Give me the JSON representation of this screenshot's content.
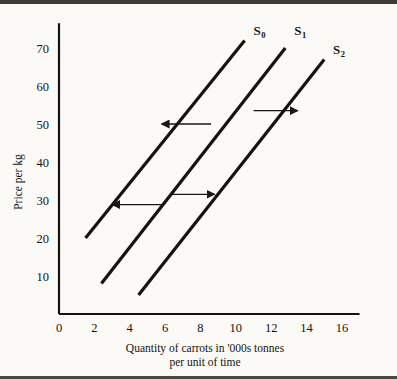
{
  "figure": {
    "background_color": "#fbfaf7",
    "ink_color": "#151310",
    "border_color": "#3d3a33"
  },
  "chart_data": {
    "type": "line",
    "title": "",
    "xlabel_line1": "Quantity of carrots in '000s tonnes",
    "xlabel_line2": "per unit of time",
    "ylabel": "Price per kg",
    "xlim": [
      0,
      17
    ],
    "ylim": [
      0,
      76
    ],
    "grid": false,
    "legend_position": "inline-at-curve-end",
    "xticks": [
      0,
      2,
      4,
      6,
      8,
      10,
      12,
      14,
      16
    ],
    "xticklabels": [
      "0",
      "2",
      "4",
      "6",
      "8",
      "10",
      "12",
      "14",
      "16"
    ],
    "yticks": [
      10,
      20,
      30,
      40,
      50,
      60,
      70
    ],
    "yticklabels": [
      "10",
      "20",
      "30",
      "40",
      "50",
      "60",
      "70"
    ],
    "series": [
      {
        "name": "S0",
        "label_base": "S",
        "label_sub": "0",
        "x": [
          1.5,
          10.5
        ],
        "y": [
          20,
          72
        ],
        "label_x": 11.0,
        "label_y": 73.5
      },
      {
        "name": "S1",
        "label_base": "S",
        "label_sub": "1",
        "x": [
          2.4,
          12.8
        ],
        "y": [
          8,
          70
        ],
        "label_x": 13.3,
        "label_y": 73.5
      },
      {
        "name": "S2",
        "label_base": "S",
        "label_sub": "2",
        "x": [
          4.5,
          15.0
        ],
        "y": [
          5,
          67
        ],
        "label_x": 15.5,
        "label_y": 68.5
      }
    ],
    "annotations": [
      {
        "name": "shift-arrow-upper-left",
        "direction": "left",
        "x_from": 8.6,
        "x_to": 5.8,
        "y": 50.0,
        "meaning": "decrease in supply: S1 shifts left to S0"
      },
      {
        "name": "shift-arrow-upper-right",
        "direction": "right",
        "x_from": 11.0,
        "x_to": 13.5,
        "y": 53.5,
        "meaning": "increase in supply: S1 shifts right to S2"
      },
      {
        "name": "shift-arrow-lower-left",
        "direction": "left",
        "x_from": 5.9,
        "x_to": 3.0,
        "y": 28.8,
        "meaning": "decrease in supply: S1 shifts left to S0"
      },
      {
        "name": "shift-arrow-lower-right",
        "direction": "right",
        "x_from": 6.3,
        "x_to": 8.8,
        "y": 31.5,
        "meaning": "increase in supply: S1 shifts right to S2"
      }
    ]
  }
}
